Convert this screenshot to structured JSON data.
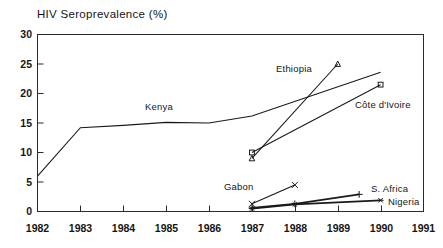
{
  "chart_data": {
    "type": "line",
    "title": "HIV Seroprevalence (%)",
    "xlabel": "",
    "ylabel": "",
    "xlim": [
      1982,
      1991
    ],
    "ylim": [
      0,
      30
    ],
    "yticks": [
      0,
      5,
      10,
      15,
      20,
      25,
      30
    ],
    "xticks": [
      1982,
      1983,
      1984,
      1985,
      1986,
      1987,
      1988,
      1989,
      1990,
      1991
    ],
    "grid": false,
    "legend": "inline-labels",
    "series": [
      {
        "name": "Kenya",
        "marker": "none",
        "x": [
          1982,
          1983,
          1984,
          1985,
          1986,
          1987,
          1990
        ],
        "y": [
          6.0,
          14.2,
          14.6,
          15.1,
          15.0,
          16.2,
          23.6
        ]
      },
      {
        "name": "Ethiopia",
        "marker": "triangle",
        "x": [
          1987,
          1989
        ],
        "y": [
          9.0,
          25.0
        ]
      },
      {
        "name": "Côte d'Ivoire",
        "marker": "square",
        "x": [
          1987,
          1990
        ],
        "y": [
          10.0,
          21.5
        ]
      },
      {
        "name": "Gabon",
        "marker": "x",
        "x": [
          1987,
          1988
        ],
        "y": [
          1.3,
          4.5
        ]
      },
      {
        "name": "S. Africa",
        "marker": "plus",
        "x": [
          1987,
          1988,
          1989.5
        ],
        "y": [
          0.6,
          1.3,
          2.9
        ]
      },
      {
        "name": "Nigeria",
        "marker": "star",
        "x": [
          1987,
          1988,
          1990
        ],
        "y": [
          0.5,
          1.2,
          1.9
        ]
      }
    ],
    "series_label_positions": [
      {
        "name": "Kenya",
        "x": 145,
        "y": 110
      },
      {
        "name": "Ethiopia",
        "x": 276,
        "y": 72
      },
      {
        "name": "Côte d'Ivoire",
        "x": 355,
        "y": 108
      },
      {
        "name": "Gabon",
        "x": 224,
        "y": 190
      },
      {
        "name": "S. Africa",
        "x": 371,
        "y": 192
      },
      {
        "name": "Nigeria",
        "x": 388,
        "y": 205
      }
    ]
  },
  "axis": {
    "y_tick_labels": [
      "30",
      "25",
      "20",
      "15",
      "10",
      "5",
      "0"
    ],
    "x_tick_labels": [
      "1982",
      "1983",
      "1984",
      "1985",
      "1986",
      "1987",
      "1988",
      "1989",
      "1990",
      "1991"
    ]
  }
}
